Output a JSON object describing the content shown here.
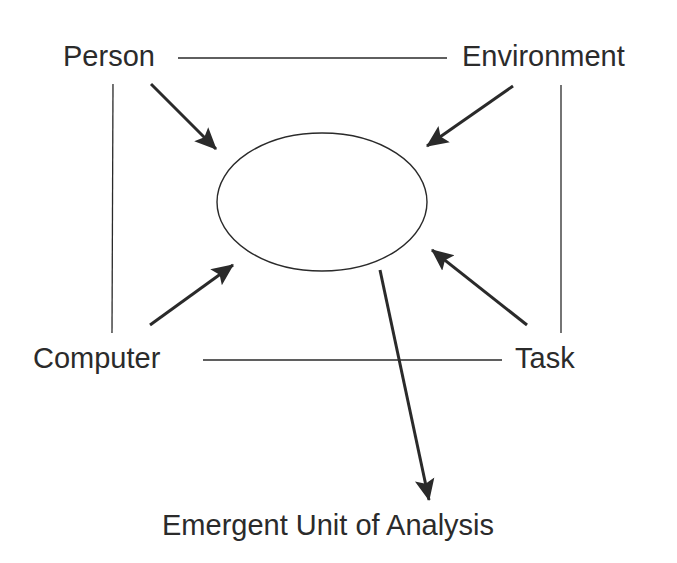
{
  "diagram": {
    "nodes": {
      "person": "Person",
      "environment": "Environment",
      "computer": "Computer",
      "task": "Task",
      "center": "",
      "output": "Emergent Unit of Analysis"
    },
    "edges": [
      {
        "from": "Person",
        "to": "Environment",
        "type": "line"
      },
      {
        "from": "Person",
        "to": "Computer",
        "type": "line"
      },
      {
        "from": "Environment",
        "to": "Task",
        "type": "line"
      },
      {
        "from": "Computer",
        "to": "Task",
        "type": "line"
      },
      {
        "from": "Person",
        "to": "center-ellipse",
        "type": "arrow"
      },
      {
        "from": "Environment",
        "to": "center-ellipse",
        "type": "arrow"
      },
      {
        "from": "Computer",
        "to": "center-ellipse",
        "type": "arrow"
      },
      {
        "from": "Task",
        "to": "center-ellipse",
        "type": "arrow"
      },
      {
        "from": "center-ellipse",
        "to": "Emergent Unit of Analysis",
        "type": "arrow"
      }
    ],
    "colors": {
      "stroke": "#2a2a2a",
      "background": "#ffffff"
    }
  }
}
